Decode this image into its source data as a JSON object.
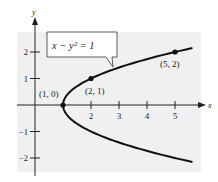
{
  "chart_data": {
    "type": "line",
    "title": "",
    "equation_label": "x − y² = 1",
    "xlabel": "x",
    "ylabel": "y",
    "xlim": [
      -0.6,
      6.0
    ],
    "ylim": [
      -2.5,
      2.7
    ],
    "grid": false,
    "x_ticks": [
      2,
      3,
      4,
      5
    ],
    "x_tick_labels": [
      "2",
      "3",
      "4",
      "5"
    ],
    "y_ticks": [
      2,
      1,
      -1,
      -2
    ],
    "y_tick_labels": [
      "2",
      "1",
      "−1",
      "−2"
    ],
    "series": [
      {
        "name": "x − y² = 1",
        "description": "parabola x = 1 + y^2 opening right",
        "y_range": [
          -2.15,
          2.15
        ]
      }
    ],
    "points": [
      {
        "x": 1,
        "y": 0,
        "label": "(1, 0)"
      },
      {
        "x": 2,
        "y": 1,
        "label": "(2, 1)"
      },
      {
        "x": 5,
        "y": 2,
        "label": "(5, 2)"
      }
    ],
    "colors": {
      "plot_background": "#f0f0f0",
      "curve": "#111111",
      "axis": "#222222",
      "label_box_fill": "#ffffff",
      "label_box_stroke": "#333333"
    }
  }
}
